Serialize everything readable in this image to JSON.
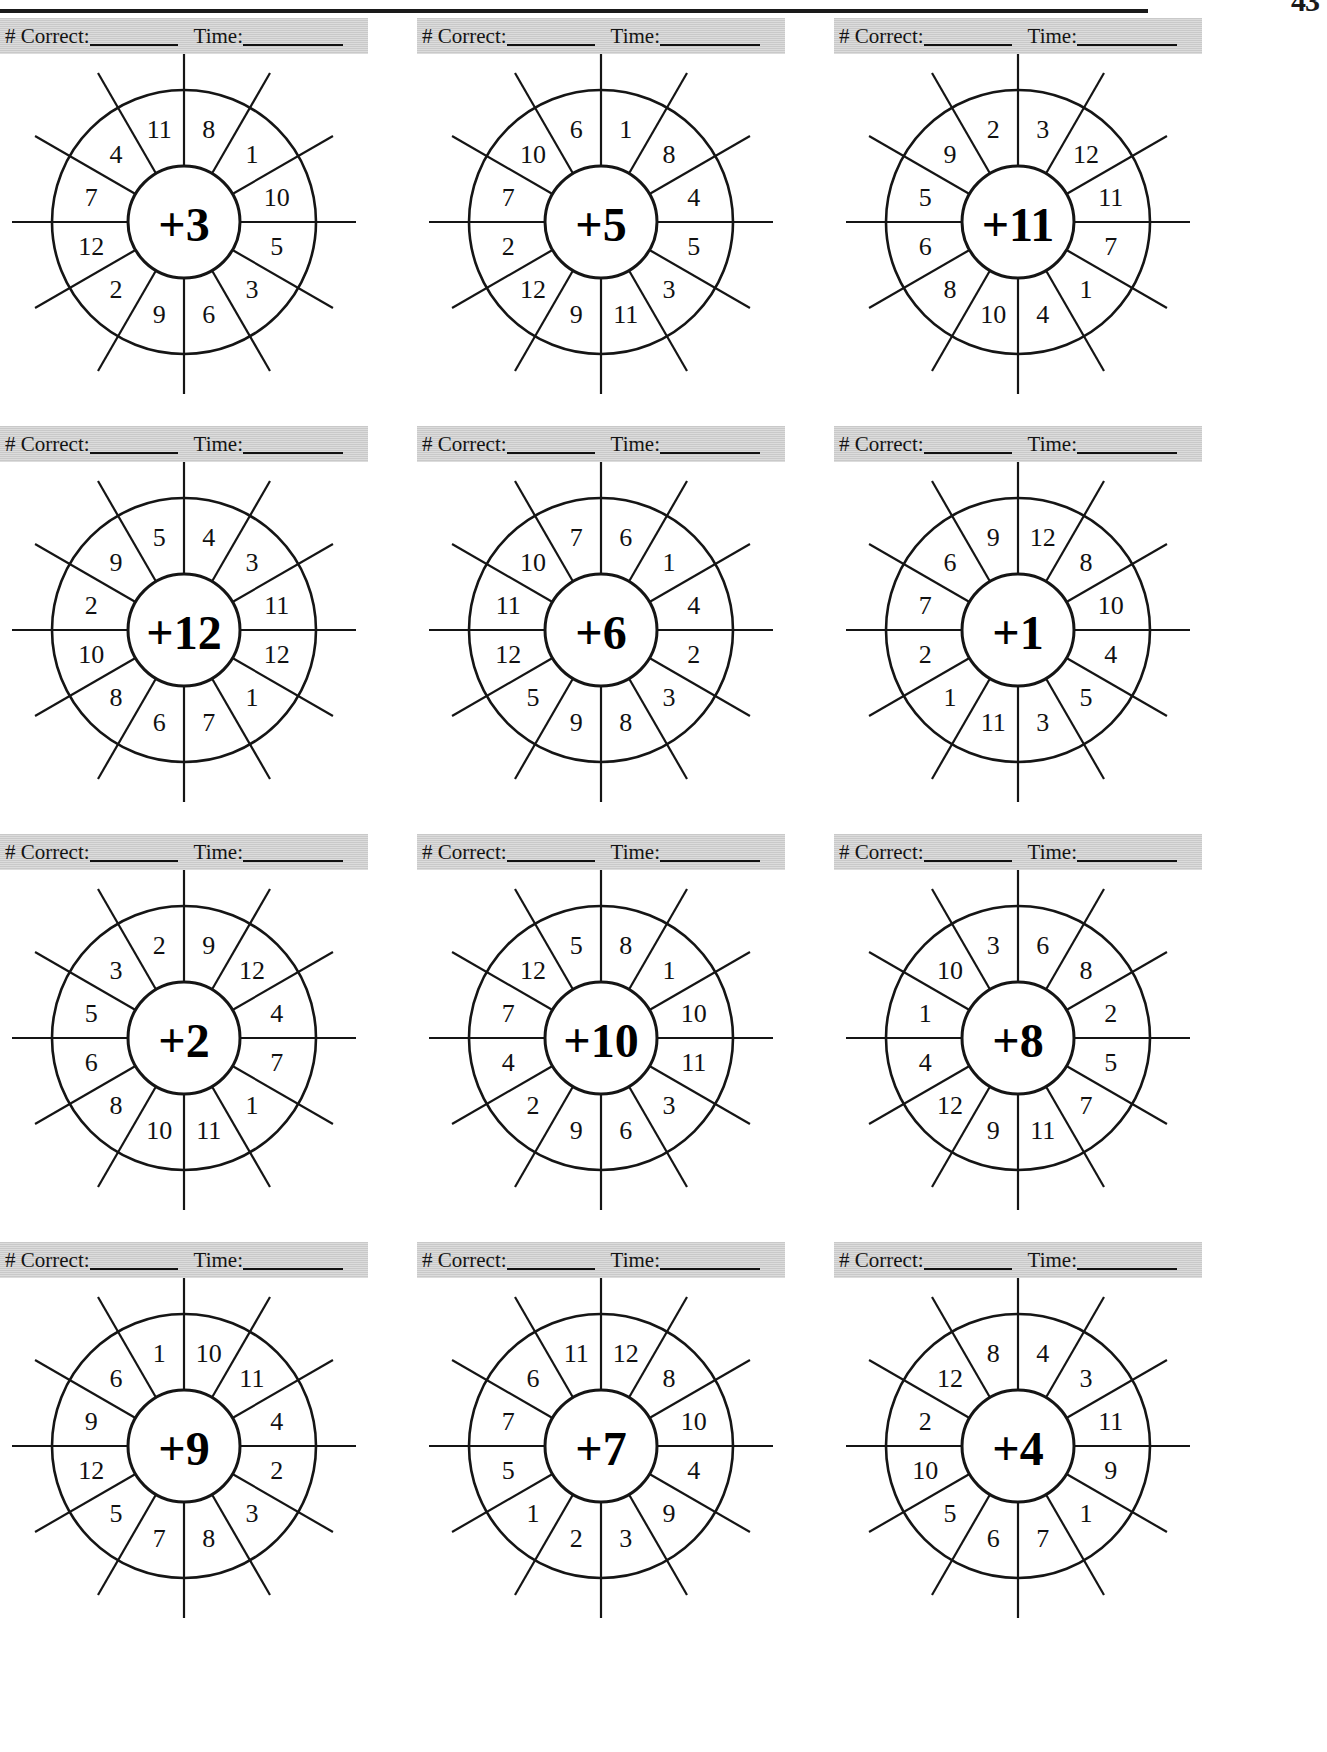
{
  "page": {
    "page_number": "43"
  },
  "score_band": {
    "correct_label": "# Correct:",
    "time_label": "Time:",
    "correct_value": "",
    "time_value": ""
  },
  "chart_data": {
    "type": "table",
    "wheels": [
      {
        "center": "+3",
        "numbers": [
          "8",
          "1",
          "10",
          "5",
          "3",
          "6",
          "9",
          "2",
          "12",
          "7",
          "4",
          "11"
        ]
      },
      {
        "center": "+5",
        "numbers": [
          "1",
          "8",
          "4",
          "5",
          "3",
          "11",
          "9",
          "12",
          "2",
          "7",
          "10",
          "6"
        ]
      },
      {
        "center": "+11",
        "numbers": [
          "3",
          "12",
          "11",
          "7",
          "1",
          "4",
          "10",
          "8",
          "6",
          "5",
          "9",
          "2"
        ]
      },
      {
        "center": "+12",
        "numbers": [
          "4",
          "3",
          "11",
          "12",
          "1",
          "7",
          "6",
          "8",
          "10",
          "2",
          "9",
          "5"
        ]
      },
      {
        "center": "+6",
        "numbers": [
          "6",
          "1",
          "4",
          "2",
          "3",
          "8",
          "9",
          "5",
          "12",
          "11",
          "10",
          "7"
        ]
      },
      {
        "center": "+1",
        "numbers": [
          "12",
          "8",
          "10",
          "4",
          "5",
          "3",
          "11",
          "1",
          "2",
          "7",
          "6",
          "9"
        ]
      },
      {
        "center": "+2",
        "numbers": [
          "9",
          "12",
          "4",
          "7",
          "1",
          "11",
          "10",
          "8",
          "6",
          "5",
          "3",
          "2"
        ]
      },
      {
        "center": "+10",
        "numbers": [
          "8",
          "1",
          "10",
          "11",
          "3",
          "6",
          "9",
          "2",
          "4",
          "7",
          "12",
          "5"
        ]
      },
      {
        "center": "+8",
        "numbers": [
          "6",
          "8",
          "2",
          "5",
          "7",
          "11",
          "9",
          "12",
          "4",
          "1",
          "10",
          "3"
        ]
      },
      {
        "center": "+9",
        "numbers": [
          "10",
          "11",
          "4",
          "2",
          "3",
          "8",
          "7",
          "5",
          "12",
          "9",
          "6",
          "1"
        ]
      },
      {
        "center": "+7",
        "numbers": [
          "12",
          "8",
          "10",
          "4",
          "9",
          "3",
          "2",
          "1",
          "5",
          "7",
          "6",
          "11"
        ]
      },
      {
        "center": "+4",
        "numbers": [
          "4",
          "3",
          "11",
          "9",
          "1",
          "7",
          "6",
          "5",
          "10",
          "2",
          "12",
          "8"
        ]
      }
    ],
    "colors": {
      "ink": "#151515",
      "band": "#c9c9c9",
      "paper": "#ffffff"
    }
  }
}
